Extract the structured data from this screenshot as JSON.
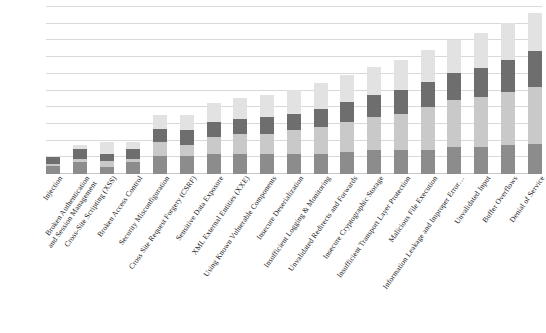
{
  "chart_data": {
    "type": "bar",
    "subtype": "stacked",
    "title": "",
    "subtitle": "",
    "xlabel": "",
    "ylabel": "",
    "grid": true,
    "gridlines": 10,
    "legend": "none",
    "ylim": [
      0,
      100
    ],
    "axis_tick_labels": [],
    "series": [
      {
        "name": "segment-1",
        "color": "#8c8c8c",
        "values": [
          5,
          7,
          4,
          7,
          11,
          11,
          12,
          12,
          12,
          12,
          12,
          13,
          14,
          14,
          14,
          16,
          16,
          17,
          18
        ]
      },
      {
        "name": "segment-2",
        "color": "#c9c9c9",
        "values": [
          1,
          2,
          4,
          2,
          8,
          6,
          10,
          12,
          12,
          14,
          16,
          18,
          20,
          22,
          26,
          28,
          30,
          32,
          34
        ]
      },
      {
        "name": "segment-3",
        "color": "#6e6e6e",
        "values": [
          4,
          6,
          4,
          6,
          8,
          9,
          9,
          9,
          10,
          10,
          11,
          12,
          13,
          14,
          15,
          16,
          17,
          19,
          21
        ]
      },
      {
        "name": "segment-4",
        "color": "#e2e2e2",
        "values": [
          1,
          2,
          7,
          4,
          8,
          9,
          11,
          12,
          13,
          14,
          15,
          16,
          17,
          18,
          19,
          20,
          21,
          22,
          23
        ]
      }
    ],
    "totals": [
      11,
      17,
      19,
      19,
      35,
      35,
      42,
      45,
      47,
      50,
      54,
      59,
      64,
      68,
      74,
      80,
      84,
      90,
      96
    ],
    "categories": [
      "Injection",
      "Broken Authentication and Session Management",
      "Cross-Site Scripting (XSS)",
      "Broken Access Control",
      "Security Misconfiguration",
      "Cross Site Request Forgery (CSRF)",
      "Sensitive Data Exposure",
      "XML External Entities (XXE)",
      "Using Known Vulnerable Components",
      "Insecure Deserialization",
      "Insufficient Logging & Monitoring",
      "Unvalidated Redirects and Forwards",
      "Insecure Cryptographic Storage",
      "Insufficient Transport Layer Protection",
      "Malicious File Execution",
      "Information Leakage and Improper Error…",
      "Unvalidated Input",
      "Buffer Overflows",
      "Denial of Service"
    ],
    "category_lines": [
      [
        "Injection"
      ],
      [
        "Broken Authentication",
        "and Session Management"
      ],
      [
        "Cross-Site Scripting (XSS)"
      ],
      [
        "Broken Access Control"
      ],
      [
        "Security Misconfiguration"
      ],
      [
        "Cross Site Request Forgery (CSRF)"
      ],
      [
        "Sensitive Data Exposure"
      ],
      [
        "XML External Entities (XXE)"
      ],
      [
        "Using Known Vulnerable Components"
      ],
      [
        "Insecure Deserialization"
      ],
      [
        "Insufficient Logging & Monitoring"
      ],
      [
        "Unvalidated Redirects and Forwards"
      ],
      [
        "Insecure Cryptographic Storage"
      ],
      [
        "Insufficient Transport Layer Protection"
      ],
      [
        "Malicious File Execution"
      ],
      [
        "Information Leakage and Improper Error…"
      ],
      [
        "Unvalidated Input"
      ],
      [
        "Buffer Overflows"
      ],
      [
        "Denial of Service"
      ]
    ]
  },
  "colors": {
    "gridline": "#d9d9d9",
    "background": "#ffffff",
    "label_text": "#242424"
  }
}
